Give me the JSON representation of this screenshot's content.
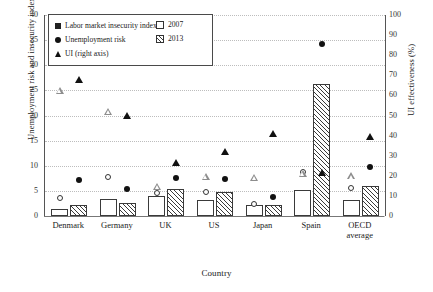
{
  "chart_data": {
    "type": "bar",
    "title": "",
    "xlabel": "Country",
    "ylabel": "Unemployment risk and insecurity index (%)",
    "ylabel_right": "UI effectiveness (%)",
    "ylim": [
      0,
      40
    ],
    "ylim_right": [
      0,
      100
    ],
    "ytick_step": 5,
    "ytick_step_right": 10,
    "yticks": [
      "0",
      "5",
      "10",
      "15",
      "20",
      "25",
      "30",
      "35",
      "40"
    ],
    "yticks_right": [
      "0",
      "10",
      "20",
      "30",
      "40",
      "50",
      "60",
      "70",
      "80",
      "90",
      "100"
    ],
    "grid": true,
    "grid_style": "dotted-horizontal",
    "legend_position": "upper-left-inside",
    "categories": [
      "Denmark",
      "Germany",
      "UK",
      "US",
      "Japan",
      "Spain",
      "OECD average"
    ],
    "series": [
      {
        "name": "Labor market insecurity index",
        "marker": "square",
        "render": "bar",
        "axis": "left",
        "groups": [
          {
            "name": "2007",
            "fill": "open",
            "values": [
              1.3,
              3.3,
              4.0,
              3.1,
              2.2,
              5.2,
              3.1
            ]
          },
          {
            "name": "2013",
            "fill": "hatched",
            "values": [
              2.1,
              2.5,
              5.4,
              4.8,
              2.1,
              26.2,
              6.0
            ]
          }
        ]
      },
      {
        "name": "Unemployment risk",
        "marker": "circle",
        "render": "point",
        "axis": "left",
        "groups": [
          {
            "name": "2007",
            "fill": "open",
            "values": [
              3.6,
              7.8,
              4.6,
              4.7,
              2.4,
              8.7,
              5.6
            ]
          },
          {
            "name": "2013",
            "fill": "filled",
            "values": [
              7.2,
              5.3,
              7.5,
              7.4,
              3.7,
              34.3,
              9.8
            ]
          }
        ]
      },
      {
        "name": "UI (right axis)",
        "marker": "triangle",
        "render": "point",
        "axis": "right",
        "groups": [
          {
            "name": "2007",
            "fill": "open",
            "values": [
              62.5,
              55.5,
              21.5,
              30.0,
              33.0,
              38.7,
              40.8
            ]
          },
          {
            "name": "2013",
            "fill": "filled",
            "values": [
              68.0,
              50.0,
              26.8,
              32.3,
              40.8,
              21.8,
              39.5
            ]
          }
        ]
      }
    ]
  },
  "legend": {
    "left_entries": [
      {
        "label": "Labor market insecurity index",
        "icon": "filled-square-marker"
      },
      {
        "label": "Unemployment risk",
        "icon": "filled-circle-marker"
      },
      {
        "label": "UI (right axis)",
        "icon": "filled-triangle-marker"
      }
    ],
    "right_entries": [
      {
        "label": "2007",
        "icon": "open-bar-swatch"
      },
      {
        "label": "2013",
        "icon": "hatched-bar-swatch"
      }
    ]
  }
}
